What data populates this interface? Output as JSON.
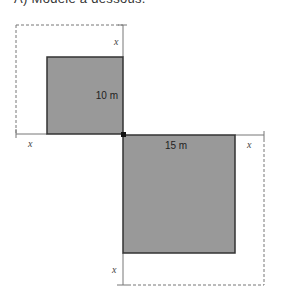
{
  "caption": "A) Modèle à dessous.",
  "diagram": {
    "fill_color": "#999999",
    "stroke_color": "#333333",
    "small_square": {
      "label": "10 m",
      "side_m": 10
    },
    "large_square": {
      "label": "15 m",
      "side_m": 15
    },
    "offset_labels": [
      "x",
      "x",
      "x",
      "x"
    ]
  }
}
